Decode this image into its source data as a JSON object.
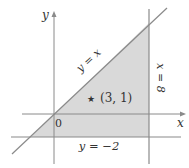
{
  "diagram": {
    "axes": {
      "x_label": "x",
      "y_label": "y",
      "origin_label": "0"
    },
    "lines": {
      "diagonal_label": "y = x",
      "vertical_label": "x = 8",
      "horizontal_label": "y = −2"
    },
    "point": {
      "marker": "★",
      "label": "(3, 1)"
    },
    "colors": {
      "region_fill": "#d9d9d9",
      "line": "#8a8a8a",
      "text": "#333333"
    }
  }
}
